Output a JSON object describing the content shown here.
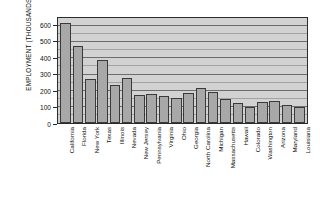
{
  "chart_data": {
    "type": "bar",
    "title": "",
    "xlabel": "",
    "ylabel": "EMPLOYMENT (THOUSANDS)",
    "ylim": [
      0,
      650
    ],
    "ytick_values": [
      0,
      100,
      200,
      300,
      400,
      500,
      600
    ],
    "ytick_labels": [
      "0",
      "100",
      "200",
      "300",
      "400",
      "500",
      "600"
    ],
    "gridlines": "horizontal, every 50 thousand",
    "legend": "none",
    "categories": [
      "California",
      "Florida",
      "New York",
      "Texas",
      "Illinois",
      "Nevada",
      "New Jersey",
      "Pennsylvania",
      "Virginia",
      "Ohio",
      "Georgia",
      "North Carolina",
      "Michigan",
      "Massachusetts",
      "Hawaii",
      "Colorado",
      "Washington",
      "Arizona",
      "Maryland",
      "Louisiana"
    ],
    "values": [
      610,
      465,
      265,
      385,
      230,
      275,
      170,
      175,
      165,
      150,
      180,
      215,
      190,
      145,
      120,
      100,
      130,
      135,
      110,
      95
    ],
    "colors": {
      "bar_fill": "#a8a8a8",
      "bar_edge": "#3a3a3a",
      "panel_fill": "#d2d2d2",
      "panel_edge": "#2b2b2b",
      "grid": "#6d6d6d",
      "text": "#111111",
      "background": "#ffffff"
    }
  }
}
